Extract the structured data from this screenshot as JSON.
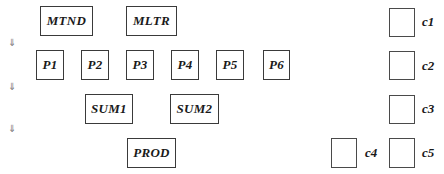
{
  "rows": {
    "row1": [
      "MTND",
      "MLTR"
    ],
    "row2": [
      "P1",
      "P2",
      "P3",
      "P4",
      "P5",
      "P6"
    ],
    "row3": [
      "SUM1",
      "SUM2"
    ],
    "row4": [
      "PROD"
    ]
  },
  "checks": {
    "c1": "c1",
    "c2": "c2",
    "c3": "c3",
    "c4": "c4",
    "c5": "c5"
  },
  "arrows": [
    "⇓",
    "⇓",
    "⇓"
  ]
}
